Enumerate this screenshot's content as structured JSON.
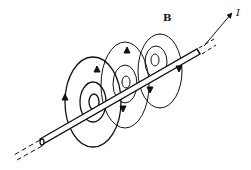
{
  "diagram": {
    "type": "magnetic-field-around-current-carrying-wire",
    "labels": {
      "field": "B",
      "current": "I"
    },
    "colors": {
      "stroke": "#111111",
      "background": "#ffffff"
    },
    "field_loop_groups": 3,
    "wire_direction": "lower-left to upper-right"
  }
}
